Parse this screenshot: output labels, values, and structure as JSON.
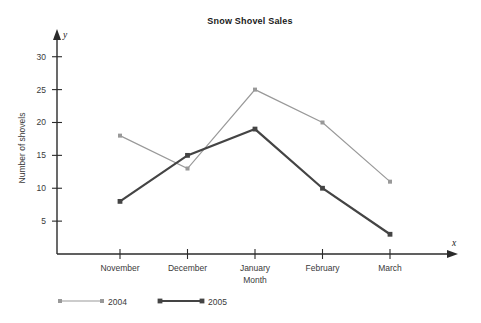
{
  "chart_data": {
    "type": "line",
    "title": "Snow Shovel Sales",
    "xlabel": "Month",
    "ylabel": "Number of shovels",
    "x_axis_variable": "x",
    "y_axis_variable": "y",
    "categories": [
      "November",
      "December",
      "January",
      "February",
      "March"
    ],
    "y_ticks": [
      5,
      10,
      15,
      20,
      25,
      30
    ],
    "ylim": [
      0,
      33
    ],
    "grid": false,
    "legend_position": "bottom-left",
    "series": [
      {
        "name": "2004",
        "color": "#999999",
        "line_width": 1.2,
        "values": [
          18,
          13,
          25,
          20,
          11
        ]
      },
      {
        "name": "2005",
        "color": "#444444",
        "line_width": 2.2,
        "values": [
          8,
          15,
          19,
          10,
          3
        ]
      }
    ]
  }
}
